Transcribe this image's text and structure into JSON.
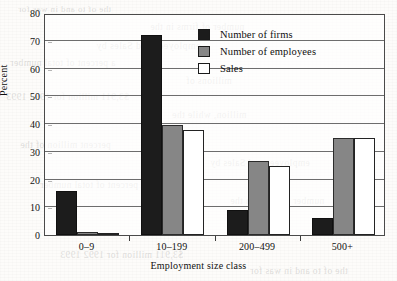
{
  "chart_data": {
    "type": "bar",
    "title": "",
    "subtitle": "",
    "xlabel": "Employment size class",
    "ylabel": "Percent",
    "categories": [
      "0–9",
      "10–199",
      "200–499",
      "500+"
    ],
    "series": [
      {
        "name": "Number of firms",
        "color": "#1c1c1c",
        "values": [
          16,
          72,
          9,
          6
        ]
      },
      {
        "name": "Number of employees",
        "color": "#868686",
        "values": [
          1,
          39.5,
          26.5,
          35
        ]
      },
      {
        "name": "Sales",
        "color": "#ffffff",
        "values": [
          0.8,
          38,
          25,
          35
        ]
      }
    ],
    "ylim": [
      0,
      80
    ],
    "yticks": [
      0,
      10,
      20,
      30,
      40,
      50,
      60,
      70,
      80
    ],
    "ytick_labels": [
      "0",
      "10",
      "20",
      "30",
      "40",
      "50",
      "60",
      "70",
      "80"
    ],
    "grid": true,
    "grid_axis": "y",
    "legend_position": "top-center-right",
    "bar_edge_color": "#1a1a1a",
    "frame_color": "#4a4a4a"
  },
  "legend": {
    "entries": [
      {
        "label": "Number of firms",
        "swatch": "firms"
      },
      {
        "label": "Number of employees",
        "swatch": "employees"
      },
      {
        "label": "Sales",
        "swatch": "sales"
      }
    ]
  },
  "bleed_through_text": [
    "the of to and in was for",
    "number of firms in the",
    "employees and Sales by",
    "a percent of total number",
    "millions of",
    "$3,911 million for 1992 1993",
    "million, while the",
    "percent million of the"
  ]
}
